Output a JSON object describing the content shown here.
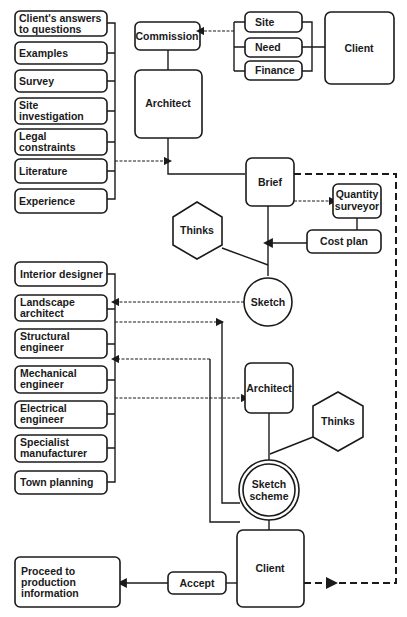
{
  "diagram": {
    "inputs": [
      {
        "lines": [
          "Client's answers",
          "to questions"
        ]
      },
      {
        "lines": [
          "Examples"
        ]
      },
      {
        "lines": [
          "Survey"
        ]
      },
      {
        "lines": [
          "Site",
          "investigation"
        ]
      },
      {
        "lines": [
          "Legal",
          "constraints"
        ]
      },
      {
        "lines": [
          "Literature"
        ]
      },
      {
        "lines": [
          "Experience"
        ]
      }
    ],
    "commission": "Commission",
    "architect_top": "Architect",
    "client_needs": [
      "Site",
      "Need",
      "Finance"
    ],
    "client_top": "Client",
    "brief": "Brief",
    "quantity_surveyor": [
      "Quantity",
      "surveyor"
    ],
    "cost_plan": "Cost plan",
    "thinks_top": "Thinks",
    "sketch": "Sketch",
    "consultants": [
      {
        "lines": [
          "Interior designer"
        ]
      },
      {
        "lines": [
          "Landscape",
          "architect"
        ]
      },
      {
        "lines": [
          "Structural",
          "engineer"
        ]
      },
      {
        "lines": [
          "Mechanical",
          "engineer"
        ]
      },
      {
        "lines": [
          "Electrical",
          "engineer"
        ]
      },
      {
        "lines": [
          "Specialist",
          "manufacturer"
        ]
      },
      {
        "lines": [
          "Town planning"
        ]
      }
    ],
    "architect_mid": "Architect",
    "thinks_mid": "Thinks",
    "sketch_scheme": [
      "Sketch",
      "scheme"
    ],
    "client_bottom": "Client",
    "accept": "Accept",
    "proceed": [
      "Proceed to",
      "production",
      "information"
    ]
  },
  "colors": {
    "ink": "#1a1a1a",
    "paper": "#ffffff"
  }
}
